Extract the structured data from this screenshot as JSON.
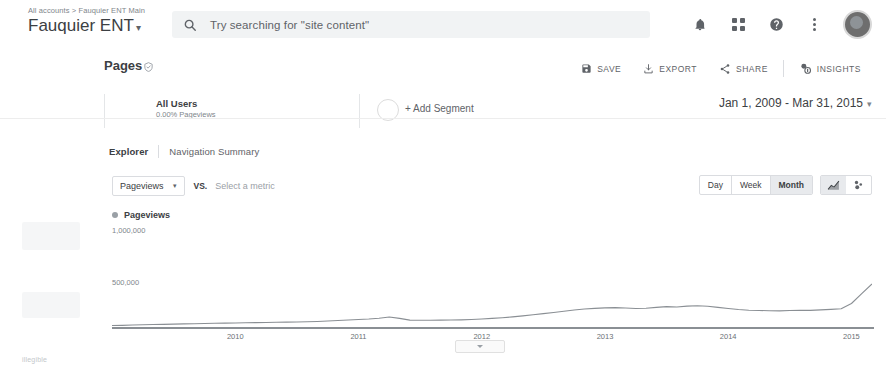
{
  "header": {
    "breadcrumb": "All accounts > Fauquier ENT Main",
    "account_name": "Fauquier ENT",
    "account_caret": "▾",
    "search_placeholder": "Try searching for \"site content\"",
    "icons": {
      "search": "search-icon",
      "bell": "notifications-bell-icon",
      "apps": "apps-grid-icon",
      "help": "help-circle-icon",
      "kebab": "more-vertical-icon",
      "avatar": "user-avatar"
    }
  },
  "report": {
    "title": "Pages",
    "shield_icon": "verified-shield-icon",
    "actions": [
      {
        "label": "SAVE",
        "icon": "save-disk-icon"
      },
      {
        "label": "EXPORT",
        "icon": "export-download-icon"
      },
      {
        "label": "SHARE",
        "icon": "share-nodes-icon"
      },
      {
        "label": "INSIGHTS",
        "icon": "insights-sparkle-icon"
      }
    ]
  },
  "segments": {
    "name": "All Users",
    "subtitle": "0.00% Pageviews",
    "add_segment_label": "+ Add Segment"
  },
  "date_range": {
    "label": "Jan 1, 2009 - Mar 31, 2015",
    "caret": "▾"
  },
  "tabs": [
    {
      "label": "Explorer",
      "active": true
    },
    {
      "label": "Navigation Summary",
      "active": false
    }
  ],
  "metric_row": {
    "primary_metric": "Pageviews",
    "caret": "▾",
    "vs_label": "VS.",
    "secondary_placeholder": "Select a metric"
  },
  "granularity": {
    "options": [
      "Day",
      "Week",
      "Month"
    ],
    "selected": "Month",
    "chart_type_icons": [
      "line-chart-icon",
      "motion-chart-icon"
    ],
    "chart_type_selected": "line-chart-icon"
  },
  "collapse_handle": {
    "icon": "chevron-up-icon"
  },
  "footer_artifact": "illegible",
  "chart_data": {
    "type": "line",
    "title": "Pageviews",
    "xlabel": "",
    "ylabel": "Pageviews",
    "legend": [
      "Pageviews"
    ],
    "legend_position": "top-left",
    "grid": false,
    "ylim": [
      0,
      1200000
    ],
    "yticks": [
      500000,
      1000000
    ],
    "ytick_labels": [
      "500,000",
      "1,000,000"
    ],
    "xtick_labels": [
      "2010",
      "2011",
      "2012",
      "2013",
      "2014",
      "2015"
    ],
    "xlim": [
      "2009-01",
      "2015-03"
    ],
    "series": [
      {
        "name": "Pageviews",
        "color": "#8a8f94",
        "x": [
          "2009-01",
          "2009-02",
          "2009-03",
          "2009-04",
          "2009-05",
          "2009-06",
          "2009-07",
          "2009-08",
          "2009-09",
          "2009-10",
          "2009-11",
          "2009-12",
          "2010-01",
          "2010-02",
          "2010-03",
          "2010-04",
          "2010-05",
          "2010-06",
          "2010-07",
          "2010-08",
          "2010-09",
          "2010-10",
          "2010-11",
          "2010-12",
          "2011-01",
          "2011-02",
          "2011-03",
          "2011-04",
          "2011-05",
          "2011-06",
          "2011-07",
          "2011-08",
          "2011-09",
          "2011-10",
          "2011-11",
          "2011-12",
          "2012-01",
          "2012-02",
          "2012-03",
          "2012-04",
          "2012-05",
          "2012-06",
          "2012-07",
          "2012-08",
          "2012-09",
          "2012-10",
          "2012-11",
          "2012-12",
          "2013-01",
          "2013-02",
          "2013-03",
          "2013-04",
          "2013-05",
          "2013-06",
          "2013-07",
          "2013-08",
          "2013-09",
          "2013-10",
          "2013-11",
          "2013-12",
          "2014-01",
          "2014-02",
          "2014-03",
          "2014-04",
          "2014-05",
          "2014-06",
          "2014-07",
          "2014-08",
          "2014-09",
          "2014-10",
          "2014-11",
          "2014-12",
          "2015-01",
          "2015-02",
          "2015-03"
        ],
        "values": [
          30000,
          32000,
          36000,
          40000,
          42000,
          45000,
          47000,
          50000,
          52000,
          55000,
          58000,
          60000,
          62000,
          64000,
          66000,
          68000,
          70000,
          72000,
          74000,
          76000,
          80000,
          86000,
          92000,
          98000,
          104000,
          110000,
          120000,
          134000,
          118000,
          96000,
          94000,
          95000,
          96000,
          98000,
          100000,
          104000,
          110000,
          118000,
          126000,
          136000,
          148000,
          162000,
          176000,
          190000,
          206000,
          220000,
          232000,
          240000,
          246000,
          250000,
          244000,
          238000,
          242000,
          252000,
          262000,
          258000,
          268000,
          272000,
          266000,
          252000,
          238000,
          226000,
          218000,
          214000,
          212000,
          210000,
          214000,
          218000,
          216000,
          222000,
          228000,
          236000,
          300000,
          420000,
          540000
        ]
      }
    ],
    "annotation": "Steep growth begins mid-2014, peaking near 900,000 pageviews at the end of the range."
  }
}
